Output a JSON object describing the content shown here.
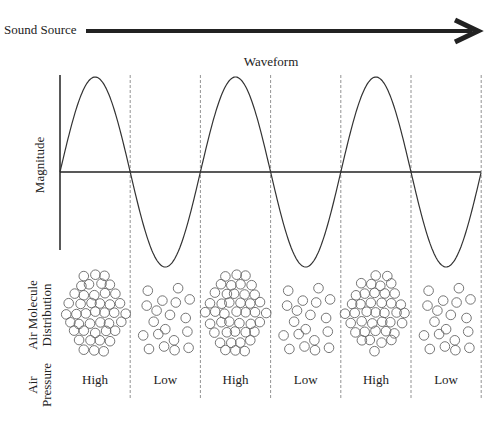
{
  "header": {
    "source_label": "Sound Source",
    "waveform_title": "Waveform"
  },
  "axes": {
    "y_label": "Magnitude"
  },
  "rows": {
    "distribution_label_line1": "Air Molecule",
    "distribution_label_line2": "Distribution",
    "pressure_label_line1": "Air",
    "pressure_label_line2": "Pressure"
  },
  "segments": [
    {
      "pressure": "High",
      "density": "dense"
    },
    {
      "pressure": "Low",
      "density": "sparse"
    },
    {
      "pressure": "High",
      "density": "dense"
    },
    {
      "pressure": "Low",
      "density": "sparse"
    },
    {
      "pressure": "High",
      "density": "dense"
    },
    {
      "pressure": "Low",
      "density": "sparse"
    }
  ],
  "colors": {
    "line": "#222222",
    "divider": "#777777",
    "molecule": "#666666"
  }
}
